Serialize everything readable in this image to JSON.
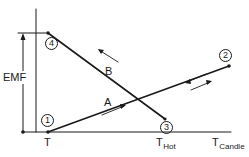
{
  "diagram": {
    "axis_labels": {
      "y": "EMF",
      "x_ticks": [
        {
          "main": "T",
          "sub": ""
        },
        {
          "main": "T",
          "sub": "Hot"
        },
        {
          "main": "T",
          "sub": "Candle"
        }
      ]
    },
    "curves": [
      {
        "label": "A",
        "from": "1",
        "to": "2",
        "through": "3",
        "arrow_direction": "up-right"
      },
      {
        "label": "B",
        "from": "3",
        "to": "4",
        "arrow_direction": "up-left"
      }
    ],
    "points": [
      {
        "id": "1",
        "label": "1"
      },
      {
        "id": "2",
        "label": "2"
      },
      {
        "id": "3",
        "label": "3"
      },
      {
        "id": "4",
        "label": "4"
      }
    ],
    "colors": {
      "ink": "#1a1a1a",
      "background": "#ffffff"
    }
  }
}
